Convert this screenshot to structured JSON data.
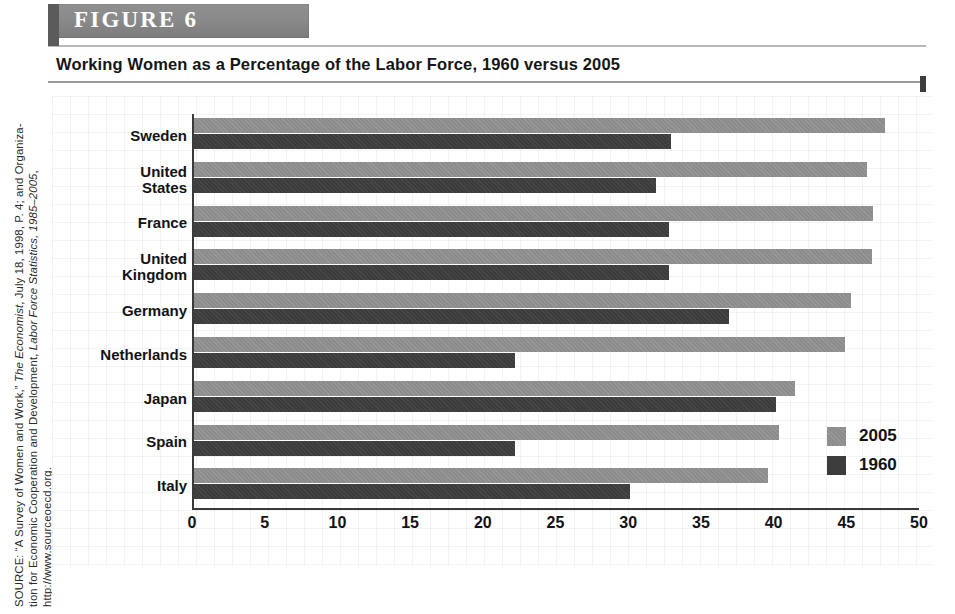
{
  "figure": {
    "band_label": "FIGURE  6",
    "title": "Working Women as a Percentage of the Labor Force, 1960 versus 2005"
  },
  "source_note": {
    "line1_a": "SOURCE: “A Survey of Women and Work,” ",
    "line1_b": "The Economist",
    "line1_c": ", July 18, 1998, P. 4; and Organiza-",
    "line2_a": "tion for Economic Cooperation and Development, ",
    "line2_b": "Labor Force Statistics, 1985–2005",
    "line2_c": ",",
    "line3": "http://www.sourceoecd.org."
  },
  "colors": {
    "series_2005": "#8c8c8c",
    "series_1960": "#3c3c3c",
    "axis": "#3a3a3a",
    "band": "#8a8a8a",
    "text": "#131313"
  },
  "legend": {
    "position": "bottom-right",
    "entries": [
      {
        "label": "2005",
        "swatch": "series_2005"
      },
      {
        "label": "1960",
        "swatch": "series_1960"
      }
    ]
  },
  "chart_data": {
    "type": "bar",
    "orientation": "horizontal",
    "title": "Working Women as a Percentage of the Labor Force, 1960 versus 2005",
    "xlabel": "",
    "ylabel": "",
    "xlim": [
      0,
      50
    ],
    "xticks": [
      0,
      5,
      10,
      15,
      20,
      25,
      30,
      35,
      40,
      45,
      50
    ],
    "xtick_labels": [
      "0",
      "5",
      "10",
      "15",
      "20",
      "25",
      "30",
      "35",
      "40",
      "45",
      "50"
    ],
    "grid": false,
    "legend_position": "bottom-right",
    "categories": [
      "Sweden",
      "United\nStates",
      "France",
      "United\nKingdom",
      "Germany",
      "Netherlands",
      "Japan",
      "Spain",
      "Italy"
    ],
    "series": [
      {
        "name": "2005",
        "color": "#8c8c8c",
        "values": [
          47.5,
          46.3,
          46.7,
          46.6,
          45.2,
          44.8,
          41.3,
          40.2,
          39.5
        ]
      },
      {
        "name": "1960",
        "color": "#3c3c3c",
        "values": [
          32.8,
          31.8,
          32.7,
          32.7,
          36.8,
          22.1,
          40.0,
          22.1,
          30.0
        ]
      }
    ]
  }
}
